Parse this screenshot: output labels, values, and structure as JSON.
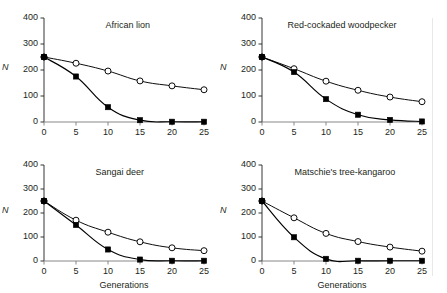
{
  "figure": {
    "background": "#ffffff",
    "axis_color": "#231f20",
    "series_color": "#000000",
    "open_marker_fill": "#ffffff"
  },
  "axes": {
    "y_label": "N",
    "x_label": "Generations",
    "y_ticks": [
      "400",
      "300",
      "200",
      "100",
      "0"
    ],
    "y_tick_values": [
      400,
      300,
      200,
      100,
      0
    ],
    "x_ticks": [
      "0",
      "5",
      "10",
      "15",
      "20",
      "25"
    ],
    "x_tick_values": [
      0,
      5,
      10,
      15,
      20,
      25
    ],
    "ylim": [
      0,
      400
    ],
    "xlim": [
      0,
      25
    ]
  },
  "chart_data": [
    {
      "type": "line",
      "title": "African lion",
      "xlabel": "",
      "ylabel": "N",
      "x": [
        0,
        5,
        10,
        15,
        20,
        25
      ],
      "xlim": [
        0,
        25
      ],
      "ylim": [
        0,
        400
      ],
      "grid": false,
      "legend": "none",
      "series": [
        {
          "name": "open-circle",
          "marker": "open-circle",
          "values": [
            250,
            226,
            196,
            158,
            139,
            124
          ]
        },
        {
          "name": "filled-square",
          "marker": "filled-square",
          "values": [
            250,
            175,
            57,
            7,
            1,
            1
          ]
        }
      ]
    },
    {
      "type": "line",
      "title": "Red-cockaded woodpecker",
      "xlabel": "",
      "ylabel": "N",
      "x": [
        0,
        5,
        10,
        15,
        20,
        25
      ],
      "xlim": [
        0,
        25
      ],
      "ylim": [
        0,
        400
      ],
      "grid": false,
      "legend": "none",
      "series": [
        {
          "name": "open-circle",
          "marker": "open-circle",
          "values": [
            250,
            205,
            157,
            122,
            96,
            78
          ]
        },
        {
          "name": "filled-square",
          "marker": "filled-square",
          "values": [
            250,
            192,
            88,
            28,
            8,
            2
          ]
        }
      ]
    },
    {
      "type": "line",
      "title": "Sangai deer",
      "xlabel": "Generations",
      "ylabel": "N",
      "x": [
        0,
        5,
        10,
        15,
        20,
        25
      ],
      "xlim": [
        0,
        25
      ],
      "ylim": [
        0,
        400
      ],
      "grid": false,
      "legend": "none",
      "series": [
        {
          "name": "open-circle",
          "marker": "open-circle",
          "values": [
            250,
            170,
            120,
            80,
            55,
            43
          ]
        },
        {
          "name": "filled-square",
          "marker": "filled-square",
          "values": [
            250,
            150,
            48,
            6,
            1,
            1
          ]
        }
      ]
    },
    {
      "type": "line",
      "title": "Matschie's tree-kangaroo",
      "xlabel": "Generations",
      "ylabel": "N",
      "x": [
        0,
        5,
        10,
        15,
        20,
        25
      ],
      "xlim": [
        0,
        25
      ],
      "ylim": [
        0,
        400
      ],
      "grid": false,
      "legend": "none",
      "series": [
        {
          "name": "open-circle",
          "marker": "open-circle",
          "values": [
            250,
            180,
            115,
            81,
            58,
            41
          ]
        },
        {
          "name": "filled-square",
          "marker": "filled-square",
          "values": [
            250,
            99,
            9,
            1,
            1,
            1
          ]
        }
      ]
    }
  ]
}
